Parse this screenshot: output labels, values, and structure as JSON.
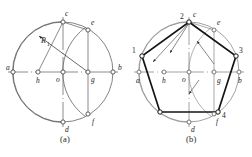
{
  "figure": {
    "captions": [
      {
        "id": "caption-a",
        "text": "(a)"
      },
      {
        "id": "caption-b",
        "text": "(b)"
      }
    ],
    "panels": [
      {
        "id": "panel-a",
        "caption": "(a)",
        "description": "Construction step: locate midpoint h of radius ao, swing radius R1 from h through c to find g on ab, then arc from g.",
        "center": {
          "x": 63,
          "y": 72
        },
        "radius": 50,
        "annotations": [
          {
            "name": "radius-label-R1",
            "text": "R",
            "subscript": "1",
            "x": 44,
            "y": 40
          }
        ],
        "points": [
          {
            "label": "a",
            "x": 13,
            "y": 72,
            "label_dx": -7,
            "label_dy": -4,
            "note": "left end of horizontal diameter"
          },
          {
            "label": "b",
            "x": 113,
            "y": 72,
            "label_dx": 5,
            "label_dy": -4,
            "note": "right end of horizontal diameter"
          },
          {
            "label": "c",
            "x": 63,
            "y": 22,
            "label_dx": 2,
            "label_dy": -8,
            "note": "top of circle"
          },
          {
            "label": "d",
            "x": 63,
            "y": 122,
            "label_dx": 2,
            "label_dy": 8,
            "note": "bottom of circle"
          },
          {
            "label": "o",
            "x": 63,
            "y": 72,
            "label_dx": -7,
            "label_dy": 8,
            "note": "centre of circle"
          },
          {
            "label": "h",
            "x": 38,
            "y": 72,
            "label_dx": -2,
            "label_dy": 9,
            "note": "midpoint of ao"
          },
          {
            "label": "g",
            "x": 88,
            "y": 72,
            "label_dx": 3,
            "label_dy": 9,
            "note": "intersection of arc R1 with ob"
          },
          {
            "label": "e",
            "x": 88,
            "y": 30,
            "label_dx": 3,
            "label_dy": -6,
            "note": "upper intersection of arc centred g"
          },
          {
            "label": "f",
            "x": 88,
            "y": 114,
            "label_dx": 4,
            "label_dy": 8,
            "note": "lower intersection of arc centred g"
          }
        ],
        "arcs": [
          {
            "name": "main-circle",
            "cx": 63,
            "cy": 72,
            "r": 50,
            "from": 0,
            "to": 360
          },
          {
            "name": "arc-centre-h",
            "cx": 38,
            "cy": 72,
            "r": 55,
            "from": -66,
            "to": 66
          },
          {
            "name": "arc-centre-g",
            "cx": 88,
            "cy": 72,
            "r": 43,
            "from": 100,
            "to": 260
          }
        ],
        "lines": [
          {
            "name": "horizontal-diameter",
            "x1": 8,
            "y1": 72,
            "x2": 118,
            "y2": 72,
            "style": "centerline"
          },
          {
            "name": "vertical-diameter",
            "x1": 63,
            "y1": 17,
            "x2": 63,
            "y2": 127,
            "style": "centerline"
          },
          {
            "name": "chord-ce",
            "x1": 63,
            "y1": 22,
            "x2": 88,
            "y2": 30,
            "style": "thin"
          },
          {
            "name": "ordinate-e-g",
            "x1": 88,
            "y1": 30,
            "x2": 88,
            "y2": 114,
            "style": "thin"
          },
          {
            "name": "radius-hc",
            "x1": 38,
            "y1": 72,
            "x2": 63,
            "y2": 22,
            "style": "thin"
          },
          {
            "name": "leader-R1",
            "x1": 88,
            "y1": 72,
            "x2": 40,
            "y2": 36,
            "style": "leader"
          }
        ]
      },
      {
        "id": "panel-b",
        "caption": "(b)",
        "description": "Completed regular pentagon 1-2-3-4-5 inscribed in the circle, with construction arcs retained.",
        "center": {
          "x": 189,
          "y": 72
        },
        "radius": 50,
        "points": [
          {
            "label": "a",
            "x": 139,
            "y": 72,
            "label_dx": -3,
            "label_dy": 10
          },
          {
            "label": "b",
            "x": 239,
            "y": 72,
            "label_dx": 1,
            "label_dy": 10
          },
          {
            "label": "c",
            "x": 189,
            "y": 22,
            "label_dx": 4,
            "label_dy": -7
          },
          {
            "label": "d",
            "x": 189,
            "y": 122,
            "label_dx": 2,
            "label_dy": 10
          },
          {
            "label": "o",
            "x": 189,
            "y": 72,
            "label_dx": -8,
            "label_dy": 9
          },
          {
            "label": "h",
            "x": 164,
            "y": 72,
            "label_dx": -2,
            "label_dy": 10
          },
          {
            "label": "g",
            "x": 214,
            "y": 72,
            "label_dx": 3,
            "label_dy": 10
          },
          {
            "label": "e",
            "x": 214,
            "y": 30,
            "label_dx": 3,
            "label_dy": -6
          },
          {
            "label": "f",
            "x": 214,
            "y": 114,
            "label_dx": 2,
            "label_dy": 10
          }
        ],
        "pentagon": {
          "name": "inscribed-pentagon",
          "vertices": [
            {
              "number": "2",
              "x": 189,
              "y": 22,
              "label_dx": -9,
              "label_dy": -3
            },
            {
              "number": "3",
              "x": 236,
              "y": 56,
              "label_dx": 3,
              "label_dy": -4
            },
            {
              "number": "4",
              "x": 218,
              "y": 112,
              "label_dx": 4,
              "label_dy": 6
            },
            {
              "number": "5",
              "x": 160,
              "y": 112,
              "label_dx": -9,
              "label_dy": 6,
              "visible_label": false
            },
            {
              "number": "1",
              "x": 142,
              "y": 56,
              "label_dx": -10,
              "label_dy": -3
            }
          ]
        },
        "arcs": [
          {
            "name": "main-circle",
            "cx": 189,
            "cy": 72,
            "r": 50,
            "from": 0,
            "to": 360
          },
          {
            "name": "arc-centre-h",
            "cx": 164,
            "cy": 72,
            "r": 55,
            "from": -66,
            "to": 66
          },
          {
            "name": "arc-centre-g",
            "cx": 214,
            "cy": 72,
            "r": 43,
            "from": 100,
            "to": 260
          }
        ],
        "lines": [
          {
            "name": "horizontal-diameter",
            "x1": 134,
            "y1": 72,
            "x2": 244,
            "y2": 72,
            "style": "centerline"
          },
          {
            "name": "vertical-diameter",
            "x1": 189,
            "y1": 17,
            "x2": 189,
            "y2": 127,
            "style": "centerline"
          },
          {
            "name": "ordinate-e-f",
            "x1": 214,
            "y1": 30,
            "x2": 214,
            "y2": 114,
            "style": "thin"
          },
          {
            "name": "chord-ce",
            "x1": 189,
            "y1": 22,
            "x2": 214,
            "y2": 30,
            "style": "thin"
          },
          {
            "name": "step-arrow-1",
            "x1": 189,
            "y1": 22,
            "x2": 152,
            "y2": 62,
            "style": "arrow"
          },
          {
            "name": "step-arrow-2",
            "x1": 189,
            "y1": 22,
            "x2": 168,
            "y2": 52,
            "style": "arrow"
          },
          {
            "name": "step-arrow-3",
            "x1": 214,
            "y1": 62,
            "x2": 196,
            "y2": 40,
            "style": "arrow"
          },
          {
            "name": "step-arrow-4",
            "x1": 196,
            "y1": 82,
            "x2": 186,
            "y2": 94,
            "style": "arrow"
          }
        ]
      }
    ],
    "colors": {
      "line": "#3a3a3a",
      "heavy_line": "#1a1a1a",
      "centerline": "#777777",
      "text": "#1c1c1c",
      "background": "#ffffff"
    }
  }
}
